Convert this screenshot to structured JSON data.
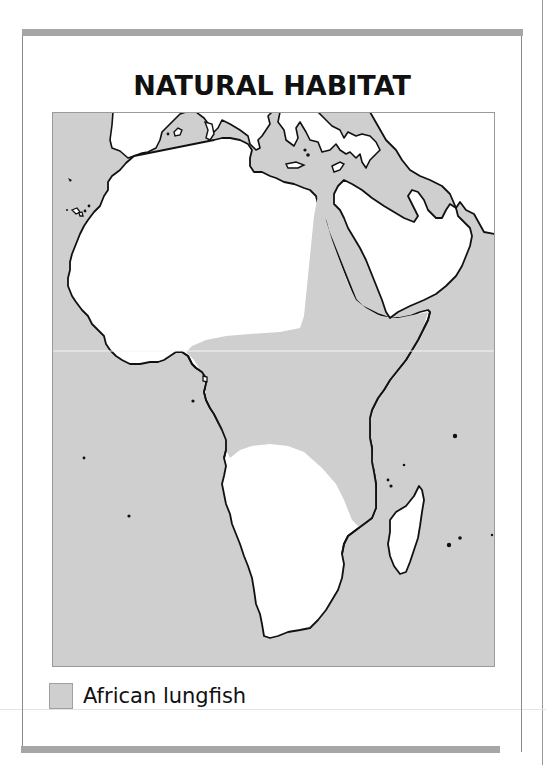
{
  "title": "NATURAL HABITAT",
  "map": {
    "region": "Africa",
    "colors": {
      "sea": "#cfcfcf",
      "land": "#ffffff",
      "habitat": "#cfcfcf",
      "coastline": "#111111"
    }
  },
  "legend": {
    "items": [
      {
        "label": "African lungfish",
        "color": "#cfcfcf"
      }
    ]
  }
}
